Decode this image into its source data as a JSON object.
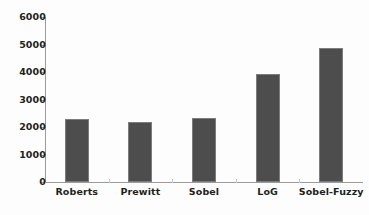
{
  "chart_data": {
    "type": "bar",
    "title": "",
    "subtitle": "",
    "xlabel": "",
    "ylabel": "",
    "categories": [
      "Roberts",
      "Prewitt",
      "Sobel",
      "LoG",
      "Sobel-Fuzzy"
    ],
    "values": [
      2310,
      2190,
      2350,
      3940,
      4900
    ],
    "series": [
      {
        "name": "",
        "values": [
          2310,
          2190,
          2350,
          3940,
          4900
        ]
      }
    ],
    "ylim": [
      0,
      6000
    ],
    "y_ticks": [
      0,
      1000,
      2000,
      3000,
      4000,
      5000,
      6000
    ],
    "y_tick_labels": [
      "0",
      "1000",
      "2000",
      "3000",
      "4000",
      "5000",
      "6000"
    ],
    "grid": false,
    "legend": false,
    "legend_position": "none",
    "bar_color": "#4d4d4d",
    "bar_edge_color": "#7d7d7d",
    "axis_color": "#9b9b9b",
    "text_color": "#231f20",
    "background_color": "#fdfdfd"
  }
}
